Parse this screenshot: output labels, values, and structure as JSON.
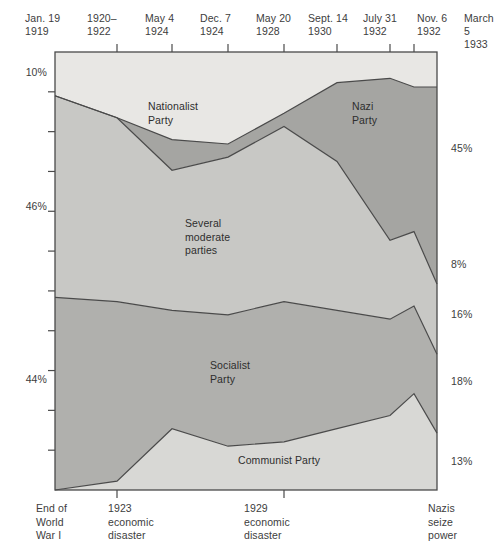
{
  "chart_data": {
    "type": "area",
    "title": "",
    "subtitle": "",
    "xlabel": "",
    "ylabel": "",
    "stacked": true,
    "percent_total": 100,
    "grid": false,
    "legend_position": "inline-labels",
    "categories": [
      "Jan. 19\n1919",
      "1920–\n1922",
      "May 4\n1924",
      "Dec. 7\n1924",
      "May 20\n1928",
      "Sept. 14\n1930",
      "July 31\n1932",
      "Nov. 6\n1932",
      "March 5\n1933"
    ],
    "x_tick_labels_line1": [
      "Jan. 19",
      "1920–",
      "May 4",
      "Dec. 7",
      "May 20",
      "Sept. 14",
      "July 31",
      "Nov. 6",
      "March 5"
    ],
    "x_tick_labels_line2": [
      "1919",
      "1922",
      "1924",
      "1924",
      "1928",
      "1930",
      "1932",
      "1932",
      "1933"
    ],
    "left_axis_labels": [
      "10%",
      "46%",
      "44%"
    ],
    "right_axis_labels": [
      "45%",
      "8%",
      "16%",
      "18%",
      "13%"
    ],
    "series": [
      {
        "name": "Nationalist Party",
        "label": "Nationalist\nParty",
        "color": "#e8e7e4",
        "start_pct": 10,
        "end_pct": 8,
        "values": [
          10,
          15,
          20,
          21,
          14,
          7,
          6,
          8,
          8
        ]
      },
      {
        "name": "Nazi Party",
        "label": "Nazi\nParty",
        "color": "#a5a5a2",
        "start_pct": 0,
        "end_pct": 45,
        "values": [
          0,
          0,
          7,
          3,
          3,
          18,
          37,
          33,
          45
        ]
      },
      {
        "name": "Several moderate parties",
        "label": "Several\nmoderate\nparties",
        "color": "#c8c8c5",
        "start_pct": 46,
        "end_pct": 16,
        "values": [
          46,
          42,
          32,
          36,
          40,
          34,
          18,
          17,
          16
        ]
      },
      {
        "name": "Socialist Party",
        "label": "Socialist\nParty",
        "color": "#b0b0ad",
        "start_pct": 44,
        "end_pct": 18,
        "values": [
          44,
          41,
          27,
          30,
          32,
          27,
          22,
          20,
          18
        ]
      },
      {
        "name": "Communist Party",
        "label": "Communist Party",
        "color": "#d8d8d5",
        "start_pct": 0,
        "end_pct": 13,
        "values": [
          0,
          2,
          14,
          10,
          11,
          14,
          17,
          22,
          13
        ]
      }
    ],
    "bottom_captions": [
      "End of\nWorld\nWar I",
      "1923\neconomic\ndisaster",
      "1929\neconomic\ndisaster",
      "Nazis\nseize\npower"
    ]
  },
  "axis": {
    "left": {
      "items": [
        {
          "text": "10%",
          "y": 66
        },
        {
          "text": "46%",
          "y": 200
        },
        {
          "text": "44%",
          "y": 373
        }
      ]
    },
    "right": {
      "items": [
        {
          "text": "45%",
          "y": 142
        },
        {
          "text": "8%",
          "y": 258
        },
        {
          "text": "16%",
          "y": 308
        },
        {
          "text": "18%",
          "y": 375
        },
        {
          "text": "13%",
          "y": 455
        }
      ]
    }
  },
  "top_ticks": [
    {
      "l1": "Jan. 19",
      "l2": "1919",
      "x": 25
    },
    {
      "l1": "1920–",
      "l2": "1922",
      "x": 87
    },
    {
      "l1": "May 4",
      "l2": "1924",
      "x": 145
    },
    {
      "l1": "Dec. 7",
      "l2": "1924",
      "x": 200
    },
    {
      "l1": "May 20",
      "l2": "1928",
      "x": 256
    },
    {
      "l1": "Sept. 14",
      "l2": "1930",
      "x": 308
    },
    {
      "l1": "July 31",
      "l2": "1932",
      "x": 363
    },
    {
      "l1": "Nov. 6",
      "l2": "1932",
      "x": 417
    },
    {
      "l1": "March 5",
      "l2": "1933",
      "x": 464
    }
  ],
  "band_labels": [
    {
      "key": "nationalist",
      "text": "Nationalist\nParty",
      "x": 148,
      "y": 100
    },
    {
      "key": "nazi",
      "text": "Nazi\nParty",
      "x": 352,
      "y": 100
    },
    {
      "key": "moderate",
      "text": "Several\nmoderate\nparties",
      "x": 185,
      "y": 217
    },
    {
      "key": "socialist",
      "text": "Socialist\nParty",
      "x": 210,
      "y": 359
    },
    {
      "key": "communist",
      "text": "Communist Party",
      "x": 238,
      "y": 454
    }
  ],
  "bottom_captions": [
    {
      "text": "End of\nWorld\nWar I",
      "x": 36
    },
    {
      "text": "1923\neconomic\ndisaster",
      "x": 108
    },
    {
      "text": "1929\neconomic\ndisaster",
      "x": 244
    },
    {
      "text": "Nazis\nseize\npower",
      "x": 428
    }
  ],
  "colors": {
    "nationalist": "#e8e7e4",
    "nazi": "#a5a5a2",
    "moderate": "#c8c8c5",
    "socialist": "#b0b0ad",
    "communist": "#d8d8d5",
    "outline": "#4a4a4a",
    "text": "#3d3d3d",
    "background": "#ffffff"
  }
}
